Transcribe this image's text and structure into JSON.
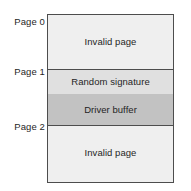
{
  "diagram": {
    "type": "memory-map",
    "colors": {
      "border": "#4d4d4d",
      "invalid_page_fill": "#efefef",
      "random_signature_fill": "#e0e0e0",
      "driver_buffer_fill": "#c2c2c2",
      "background": "#ffffff",
      "text": "#1f1f1f"
    },
    "page_labels": [
      {
        "text": "Page 0"
      },
      {
        "text": "Page 1"
      },
      {
        "text": "Page 2"
      }
    ],
    "regions": [
      {
        "id": "page0-invalid",
        "label": "Invalid page",
        "page": "Page 0"
      },
      {
        "id": "page1-signature",
        "label": "Random signature",
        "page": "Page 1"
      },
      {
        "id": "page1-driverbuffer",
        "label": "Driver buffer",
        "page": "Page 1"
      },
      {
        "id": "page2-invalid",
        "label": "Invalid page",
        "page": "Page 2"
      }
    ]
  }
}
